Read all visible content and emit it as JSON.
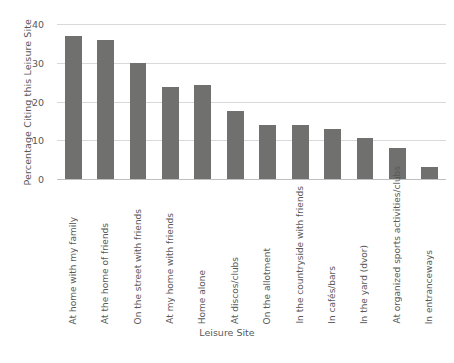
{
  "chart_data": {
    "type": "bar",
    "title": "",
    "xlabel": "Leisure Site",
    "ylabel": "Percentage Citing this Leisure Site",
    "ylim": [
      0,
      40
    ],
    "yticks": [
      0,
      10,
      20,
      30,
      40
    ],
    "ytick_labels": [
      "0",
      "10",
      "20",
      "30",
      "40"
    ],
    "grid": true,
    "grid_axis": "y",
    "legend": false,
    "bar_color": "#70706f",
    "gridline_color": "#d9d9d9",
    "axis_color": "#bfbfbf",
    "text_color": "#595959",
    "categories": [
      "At home with my family",
      "At the home of friends",
      "On the street with friends",
      "At my home with friends",
      "Home alone",
      "At discos/clubs",
      "On the allotment",
      "In the countryside with friends",
      "In cafés/bars",
      "In the yard (dvor)",
      "At organized sports activities/clubs",
      "In entranceways"
    ],
    "values": [
      37,
      36,
      30,
      23.7,
      24.2,
      17.5,
      14,
      14,
      13,
      10.5,
      8,
      3
    ]
  }
}
